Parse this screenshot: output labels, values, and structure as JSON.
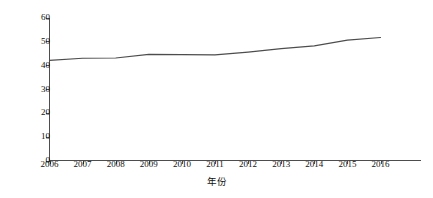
{
  "chart_data": {
    "type": "line",
    "title": "",
    "xlabel": "年份",
    "ylabel": "服务业占GDP比重(%)",
    "x": [
      2006,
      2007,
      2008,
      2009,
      2010,
      2011,
      2012,
      2013,
      2014,
      2015,
      2016
    ],
    "categories": [
      "2006",
      "2007",
      "2008",
      "2009",
      "2010",
      "2011",
      "2012",
      "2013",
      "2014",
      "2015",
      "2016"
    ],
    "values": [
      42.0,
      42.9,
      43.0,
      44.5,
      44.4,
      44.3,
      45.5,
      46.9,
      48.1,
      50.5,
      51.6
    ],
    "series": [
      {
        "name": "服务业占GDP比重(%)",
        "values": [
          42.0,
          42.9,
          43.0,
          44.5,
          44.4,
          44.3,
          45.5,
          46.9,
          48.1,
          50.5,
          51.6
        ]
      }
    ],
    "xlim": [
      2006,
      2016
    ],
    "ylim": [
      0,
      60
    ],
    "yticks": [
      0,
      10,
      20,
      30,
      40,
      50,
      60
    ],
    "ytick_labels": [
      "0",
      "10",
      "20",
      "30",
      "40",
      "50",
      "60"
    ],
    "xticks": [
      2006,
      2007,
      2008,
      2009,
      2010,
      2011,
      2012,
      2013,
      2014,
      2015,
      2016
    ],
    "grid": false,
    "legend": false,
    "legend_position": "none",
    "line_color": "#4d4d4d",
    "axis_color": "#4d4d4d",
    "background_color": "#ffffff",
    "spines": [
      "left",
      "bottom"
    ],
    "annotations": []
  }
}
